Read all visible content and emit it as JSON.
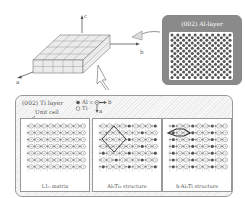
{
  "figure": {
    "crystal_block": {
      "axes": {
        "c": "c",
        "b": "b",
        "a": "a"
      },
      "grid_cols": 5,
      "grid_rows": 4,
      "layers": 2
    },
    "al_layer_box": {
      "title": "(002) Al-layer",
      "atom_color": "#555555",
      "background": "#8a8a8a"
    },
    "ti_layer_box": {
      "title": "(002) Ti layer",
      "legend": [
        {
          "symbol": "filled-circle",
          "label": "Al"
        },
        {
          "symbol": "open-circle",
          "label": "Ti"
        }
      ],
      "mini_axes": {
        "c": "c",
        "b": "b",
        "a": "a"
      },
      "unit_cell_label": "Unit cell",
      "panels": [
        {
          "caption": "L1₀ matrix",
          "type": "matrix"
        },
        {
          "caption": "Al₅Ti₃ structure",
          "type": "al5ti3"
        },
        {
          "caption": "h-Al₂Ti structure",
          "type": "h-al2ti"
        }
      ]
    }
  }
}
